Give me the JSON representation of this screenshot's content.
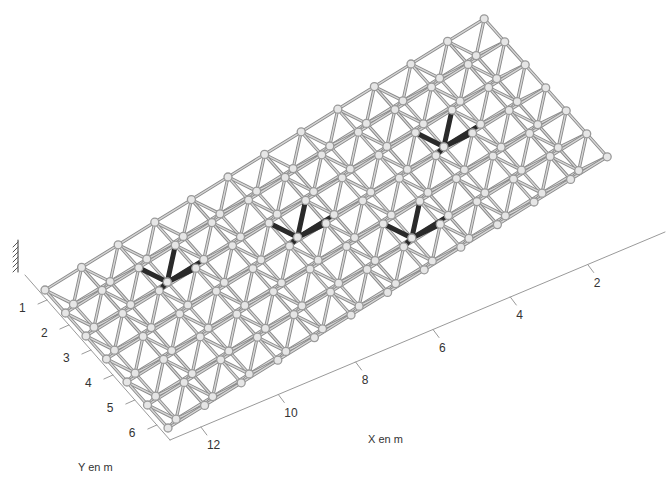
{
  "figure": {
    "type": "3d-space-truss",
    "background": "#ffffff",
    "colors": {
      "member": "#8a8a8a",
      "member_light": "#d6d6d6",
      "node": "#9a9a9a",
      "highlight": "#2a2a2a",
      "axis": "#9a9a9a",
      "text": "#333333",
      "support": "#555555"
    }
  },
  "axes": {
    "x": {
      "label": "X en m",
      "ticks": [
        {
          "value": 2,
          "label": "2"
        },
        {
          "value": 4,
          "label": "4"
        },
        {
          "value": 6,
          "label": "6"
        },
        {
          "value": 8,
          "label": "8"
        },
        {
          "value": 10,
          "label": "10"
        },
        {
          "value": 12,
          "label": "12"
        }
      ]
    },
    "y": {
      "label": "Y en m",
      "ticks": [
        {
          "value": 1,
          "label": "1"
        },
        {
          "value": 2,
          "label": "2"
        },
        {
          "value": 3,
          "label": "3"
        },
        {
          "value": 4,
          "label": "4"
        },
        {
          "value": 5,
          "label": "5"
        },
        {
          "value": 6,
          "label": "6"
        }
      ]
    }
  },
  "structure": {
    "description": "double-layer space grid (square-on-square offset)",
    "modules_x": 12,
    "modules_y": 6,
    "support_symbol": "fixed-support-hatch",
    "highlighted_members": [
      {
        "x": 2,
        "y": 1
      },
      {
        "x": 5,
        "y": 2
      },
      {
        "x": 9,
        "y": 2
      },
      {
        "x": 7,
        "y": 4
      }
    ]
  }
}
